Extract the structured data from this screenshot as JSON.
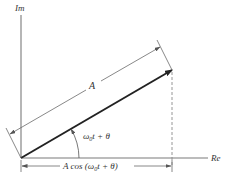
{
  "diagram": {
    "axes": {
      "imaginary_label": "Im",
      "real_label": "Re"
    },
    "phasor": {
      "magnitude_label": "A",
      "angle_label_omega": "ω",
      "angle_label_sub": "0",
      "angle_label_rest": "t + θ"
    },
    "projection": {
      "label_prefix": "A cos (",
      "label_omega": "ω",
      "label_sub": "0",
      "label_rest": "t + θ)"
    },
    "colors": {
      "axis": "#7a7a7a",
      "phasor": "#222222",
      "dimension": "#6a6a6a",
      "text": "#333333"
    }
  }
}
